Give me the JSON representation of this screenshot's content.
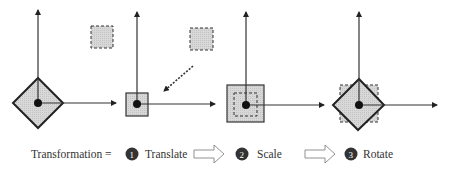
{
  "diagram": {
    "colors": {
      "stroke": "#222222",
      "fill": "#d3d3d3",
      "badge": "#333333",
      "text": "#333333"
    },
    "panels": [
      {
        "name": "original",
        "shape": "rotated-square",
        "origin": [
          38,
          103
        ]
      },
      {
        "name": "translated",
        "shape": "small-square",
        "origin": [
          137,
          104
        ]
      },
      {
        "name": "scaled",
        "shape": "large-square",
        "origin": [
          246,
          105
        ]
      },
      {
        "name": "rotated",
        "shape": "rotated-square",
        "origin": [
          359,
          105
        ]
      }
    ],
    "formula": {
      "label": "Transformation =",
      "steps": [
        {
          "number": "1",
          "label": "Translate"
        },
        {
          "number": "2",
          "label": "Scale"
        },
        {
          "number": "3",
          "label": "Rotate"
        }
      ]
    }
  }
}
